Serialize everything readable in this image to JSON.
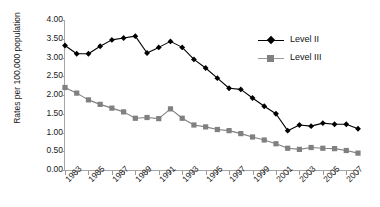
{
  "chart_data": {
    "type": "line",
    "title": "",
    "xlabel": "",
    "ylabel": "Rates per 100,000 population",
    "ylim": [
      0.0,
      4.0
    ],
    "yticks": [
      "0.00",
      "0.50",
      "1.00",
      "1.50",
      "2.00",
      "2.50",
      "3.00",
      "3.50",
      "4.00"
    ],
    "ytick_values": [
      0.0,
      0.5,
      1.0,
      1.5,
      2.0,
      2.5,
      3.0,
      3.5,
      4.0
    ],
    "grid": false,
    "legend_position": "upper-right-inside",
    "x": [
      1983,
      1984,
      1985,
      1986,
      1987,
      1988,
      1989,
      1990,
      1991,
      1992,
      1993,
      1994,
      1995,
      1996,
      1997,
      1998,
      1999,
      2000,
      2001,
      2002,
      2003,
      2004,
      2005,
      2006,
      2007,
      2008
    ],
    "xtick_labels": [
      "1983",
      "1985",
      "1987",
      "1989",
      "1991",
      "1993",
      "1995",
      "1997",
      "1999",
      "2001",
      "2003",
      "2005",
      "2007"
    ],
    "xtick_values": [
      1983,
      1985,
      1987,
      1989,
      1991,
      1993,
      1995,
      1997,
      1999,
      2001,
      2003,
      2005,
      2007
    ],
    "xlim": [
      1983,
      2008
    ],
    "series": [
      {
        "name": "Level II",
        "color": "#000000",
        "marker": "diamond",
        "values": [
          3.32,
          3.1,
          3.1,
          3.3,
          3.47,
          3.52,
          3.57,
          3.12,
          3.27,
          3.43,
          3.27,
          2.95,
          2.72,
          2.45,
          2.18,
          2.15,
          1.92,
          1.7,
          1.5,
          1.05,
          1.2,
          1.17,
          1.25,
          1.22,
          1.22,
          1.1
        ]
      },
      {
        "name": "Level III",
        "color": "#808080",
        "marker": "square",
        "values": [
          2.2,
          2.05,
          1.87,
          1.75,
          1.65,
          1.55,
          1.38,
          1.4,
          1.37,
          1.63,
          1.38,
          1.2,
          1.15,
          1.08,
          1.05,
          0.97,
          0.88,
          0.8,
          0.7,
          0.58,
          0.55,
          0.6,
          0.58,
          0.57,
          0.52,
          0.45
        ]
      }
    ]
  },
  "legend": {
    "items": [
      {
        "label": "Level II"
      },
      {
        "label": "Level III"
      }
    ]
  }
}
